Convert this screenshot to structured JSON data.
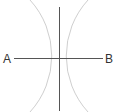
{
  "diagram": {
    "type": "perpendicular-bisector-construction",
    "points": [
      {
        "label": "A",
        "x": 14,
        "y": 58
      },
      {
        "label": "B",
        "x": 103,
        "y": 58
      }
    ],
    "segment": {
      "from": "A",
      "to": "B"
    },
    "bisector": {
      "x": 59,
      "y1": 7,
      "y2": 111
    },
    "arcs": [
      {
        "name": "arc-right-bulge",
        "cx": -33,
        "cy": 57,
        "r": 83
      },
      {
        "name": "arc-left-bulge",
        "cx": 151,
        "cy": 57,
        "r": 83
      }
    ],
    "colors": {
      "line": "#555555",
      "arc": "#cccccc",
      "label": "#333333",
      "background": "#ffffff"
    }
  }
}
